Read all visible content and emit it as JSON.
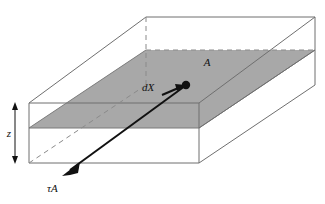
{
  "figure": {
    "type": "technical-line-diagram",
    "canvas": {
      "width": 325,
      "height": 204,
      "background": "#ffffff"
    },
    "colors": {
      "outline": "#6f6f6f",
      "shaded_plane": "#a8a8a8",
      "shaded_plane_edge": "#7a7a7a",
      "hidden_edge": "#8a8a8a",
      "arrow": "#111111",
      "text": "#111111"
    },
    "labels": {
      "area": "A",
      "displacement": "dX",
      "thickness": "z",
      "shear_force": "τA"
    },
    "annotations": [
      {
        "name": "area-label",
        "text": "A",
        "x": 207,
        "y": 66
      },
      {
        "name": "displacement-label",
        "text": "dX",
        "x": 148,
        "y": 91
      },
      {
        "name": "thickness-label",
        "text": "z",
        "x": 9,
        "y": 137
      },
      {
        "name": "shear-force-label",
        "text": "τA",
        "x": 47,
        "y": 192
      }
    ],
    "elements": {
      "outer_box": "3D rectangular prism drawn in oblique projection",
      "shaded_plane": "horizontal mid-height plane of area A",
      "thickness_dimension": "double headed vertical arrow labelled z",
      "shear_arrow": "long arrow from plane point down-left labelled tau A",
      "displacement_arrow": "short arrow labelled dX pointing up-right to marker dot",
      "marker_dot": "filled circle at plane point"
    }
  }
}
